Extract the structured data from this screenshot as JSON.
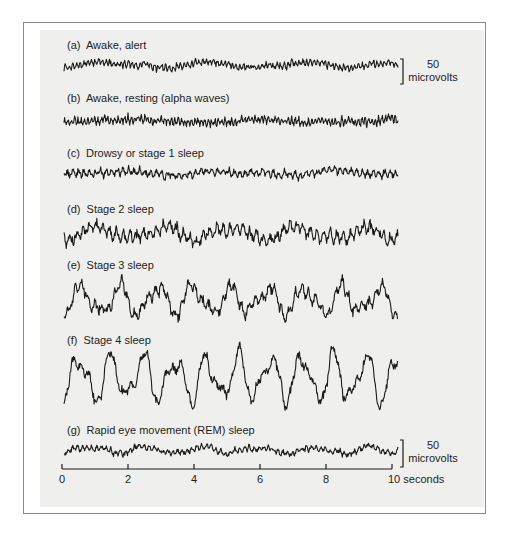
{
  "figure": {
    "traces": [
      {
        "id": "a",
        "label": "(a)  Awake, alert",
        "label_y": 39,
        "baseline": 65,
        "amp": 4.0,
        "slow_amp": 2.5,
        "slow_freq": 0.35,
        "fast_freq": 9.0,
        "noise": 0.9,
        "seed": 11
      },
      {
        "id": "b",
        "label": "(b)  Awake, resting (alpha waves)",
        "label_y": 92,
        "baseline": 121,
        "amp": 5.0,
        "slow_amp": 1.2,
        "slow_freq": 0.25,
        "fast_freq": 10.0,
        "noise": 0.8,
        "seed": 23
      },
      {
        "id": "c",
        "label": "(c)  Drowsy or stage 1 sleep",
        "label_y": 147,
        "baseline": 173,
        "amp": 5.0,
        "slow_amp": 1.5,
        "slow_freq": 0.3,
        "fast_freq": 6.0,
        "noise": 0.9,
        "seed": 37
      },
      {
        "id": "d",
        "label": "(d)  Stage 2 sleep",
        "label_y": 203,
        "baseline": 233,
        "amp": 8.0,
        "slow_amp": 5.0,
        "slow_freq": 0.5,
        "fast_freq": 5.0,
        "noise": 1.0,
        "seed": 41
      },
      {
        "id": "e",
        "label": "(e)  Stage 3 sleep",
        "label_y": 259,
        "baseline": 300,
        "amp": 8.0,
        "slow_amp": 12.0,
        "slow_freq": 0.9,
        "fast_freq": 5.0,
        "noise": 1.0,
        "seed": 53
      },
      {
        "id": "f",
        "label": "(f)  Stage 4 sleep",
        "label_y": 334,
        "baseline": 378,
        "amp": 7.0,
        "slow_amp": 20.0,
        "slow_freq": 1.05,
        "fast_freq": 4.0,
        "noise": 1.0,
        "seed": 67
      },
      {
        "id": "g",
        "label": "(g)  Rapid eye movement (REM) sleep",
        "label_y": 424,
        "baseline": 450,
        "amp": 3.5,
        "slow_amp": 3.0,
        "slow_freq": 0.6,
        "fast_freq": 7.0,
        "noise": 0.9,
        "seed": 79
      }
    ],
    "scale_bars": [
      {
        "value": "50",
        "unit": "microvolts",
        "top": 59,
        "bottom": 84
      },
      {
        "value": "50",
        "unit": "microvolts",
        "top": 440,
        "bottom": 467
      }
    ],
    "time_axis": {
      "y": 469,
      "x_start": 62,
      "x_end": 392,
      "ticks": [
        {
          "value": "0",
          "x": 62
        },
        {
          "value": "2",
          "x": 128
        },
        {
          "value": "4",
          "x": 194
        },
        {
          "value": "6",
          "x": 260
        },
        {
          "value": "8",
          "x": 326
        },
        {
          "value": "10 seconds",
          "x": 392
        }
      ],
      "unit": "seconds",
      "duration": 10
    },
    "trace_x_start": 64,
    "trace_x_end": 398,
    "line_color": "#1a1a1a",
    "panel_color": "#efefed",
    "frame_color": "#8a8a8a"
  }
}
